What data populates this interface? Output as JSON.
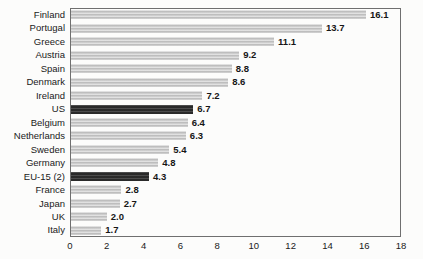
{
  "chart_data": {
    "type": "bar",
    "orientation": "horizontal",
    "title": "",
    "xlabel": "",
    "ylabel": "",
    "xlim": [
      0,
      18
    ],
    "xticks": [
      0,
      2,
      4,
      6,
      8,
      10,
      12,
      14,
      16,
      18
    ],
    "grid": false,
    "legend": "none",
    "value_labels_shown": true,
    "bars": [
      {
        "label": "Finland",
        "value": 16.1,
        "dark": false
      },
      {
        "label": "Portugal",
        "value": 13.7,
        "dark": false
      },
      {
        "label": "Greece",
        "value": 11.1,
        "dark": false
      },
      {
        "label": "Austria",
        "value": 9.2,
        "dark": false
      },
      {
        "label": "Spain",
        "value": 8.8,
        "dark": false
      },
      {
        "label": "Denmark",
        "value": 8.6,
        "dark": false
      },
      {
        "label": "Ireland",
        "value": 7.2,
        "dark": false
      },
      {
        "label": "US",
        "value": 6.7,
        "dark": true
      },
      {
        "label": "Belgium",
        "value": 6.4,
        "dark": false
      },
      {
        "label": "Netherlands",
        "value": 6.3,
        "dark": false
      },
      {
        "label": "Sweden",
        "value": 5.4,
        "dark": false
      },
      {
        "label": "Germany",
        "value": 4.8,
        "dark": false
      },
      {
        "label": "EU-15 (2)",
        "value": 4.3,
        "dark": true
      },
      {
        "label": "France",
        "value": 2.8,
        "dark": false
      },
      {
        "label": "Japan",
        "value": 2.7,
        "dark": false
      },
      {
        "label": "UK",
        "value": 2.0,
        "dark": false
      },
      {
        "label": "Italy",
        "value": 1.7,
        "dark": false
      }
    ],
    "colors": {
      "bar_light": "#c8c8c8",
      "bar_dark": "#2e2e2e",
      "plot_border": "#6f6f6f",
      "text": "#1a1a1a",
      "background": "#fcfcfb"
    }
  }
}
